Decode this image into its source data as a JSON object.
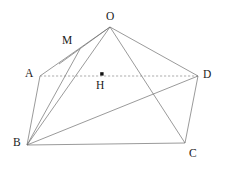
{
  "figure": {
    "width": 227,
    "height": 171,
    "background_color": "#ffffff",
    "line_color": "#6e6e6e",
    "dashed_line_color": "#8a8a8a",
    "label_color": "#1a1a1a",
    "points": [
      {
        "id": "O",
        "label": "O",
        "x": 110,
        "y": 27,
        "label_x": 106,
        "label_y": 11,
        "dot": false
      },
      {
        "id": "M",
        "label": "M",
        "x": 76,
        "y": 52,
        "label_x": 62,
        "label_y": 35,
        "dot": false
      },
      {
        "id": "A",
        "label": "A",
        "x": 40,
        "y": 76,
        "label_x": 25,
        "label_y": 68,
        "dot": false
      },
      {
        "id": "D",
        "label": "D",
        "x": 198,
        "y": 76,
        "label_x": 203,
        "label_y": 69,
        "dot": false
      },
      {
        "id": "H",
        "label": "H",
        "x": 102,
        "y": 74,
        "label_x": 96,
        "label_y": 80,
        "dot": true
      },
      {
        "id": "B",
        "label": "B",
        "x": 27,
        "y": 145,
        "label_x": 13,
        "label_y": 137,
        "dot": false
      },
      {
        "id": "C",
        "label": "C",
        "x": 185,
        "y": 143,
        "label_x": 189,
        "label_y": 148,
        "dot": false
      }
    ],
    "edges": [
      {
        "id": "OA",
        "from": "O",
        "to": "A",
        "style": "solid"
      },
      {
        "id": "OM",
        "from": "O",
        "to": "M",
        "style": "solid"
      },
      {
        "id": "OB",
        "from": "O",
        "to": "B",
        "style": "solid"
      },
      {
        "id": "OC",
        "from": "O",
        "to": "C",
        "style": "solid"
      },
      {
        "id": "OD",
        "from": "O",
        "to": "D",
        "style": "solid"
      },
      {
        "id": "AB",
        "from": "A",
        "to": "B",
        "style": "solid"
      },
      {
        "id": "AD",
        "from": "A",
        "to": "D",
        "style": "dashed"
      },
      {
        "id": "BM",
        "from": "B",
        "to": "M",
        "style": "solid"
      },
      {
        "id": "BD",
        "from": "B",
        "to": "D",
        "style": "solid"
      },
      {
        "id": "BC",
        "from": "B",
        "to": "C",
        "style": "solid"
      },
      {
        "id": "CD",
        "from": "C",
        "to": "D",
        "style": "solid"
      }
    ]
  }
}
